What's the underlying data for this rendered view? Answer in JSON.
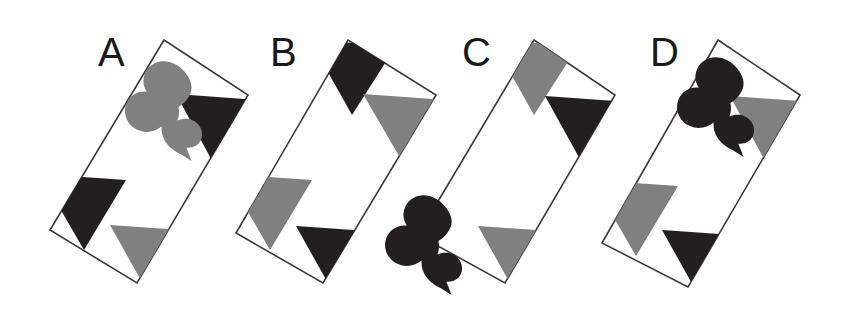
{
  "figure": {
    "kind": "visual-puzzle-figure",
    "background_color": "#ffffff",
    "width": 845,
    "height": 312,
    "palette": {
      "black": "#231f20",
      "gray": "#808080",
      "white": "#ffffff",
      "outline": "#3b3b3b",
      "label": "#1a1a1a"
    },
    "card_geometry": {
      "description": "tilted rectangle rotated clockwise about 24 degrees",
      "width": 100,
      "height": 215,
      "rotation_deg": 24
    },
    "cards": [
      {
        "label": "A",
        "label_x": 98,
        "label_y": 32,
        "center_x": 149,
        "center_y": 161,
        "corner_shapes": [
          {
            "position": "top-left",
            "type": "club",
            "color": "#808080"
          },
          {
            "position": "top-right",
            "type": "triangle",
            "color": "#231f20"
          },
          {
            "position": "bottom-left",
            "type": "triangle",
            "color": "#231f20"
          },
          {
            "position": "bottom-right",
            "type": "triangle",
            "color": "#808080"
          }
        ]
      },
      {
        "label": "B",
        "label_x": 270,
        "label_y": 32,
        "center_x": 336,
        "center_y": 161,
        "corner_shapes": [
          {
            "position": "top-left",
            "type": "triangle",
            "color": "#231f20"
          },
          {
            "position": "top-right",
            "type": "triangle",
            "color": "#808080"
          },
          {
            "position": "bottom-left",
            "type": "triangle",
            "color": "#808080"
          },
          {
            "position": "bottom-right",
            "type": "triangle",
            "color": "#231f20"
          }
        ]
      },
      {
        "label": "C",
        "label_x": 462,
        "label_y": 32,
        "center_x": 518,
        "center_y": 161,
        "corner_shapes": [
          {
            "position": "top-left",
            "type": "triangle",
            "color": "#808080"
          },
          {
            "position": "top-right",
            "type": "triangle",
            "color": "#231f20"
          },
          {
            "position": "bottom-left",
            "type": "club",
            "color": "#231f20"
          },
          {
            "position": "bottom-right",
            "type": "triangle",
            "color": "#808080"
          }
        ]
      },
      {
        "label": "D",
        "label_x": 650,
        "label_y": 32,
        "center_x": 702,
        "center_y": 163,
        "corner_shapes": [
          {
            "position": "top-left",
            "type": "club",
            "color": "#231f20"
          },
          {
            "position": "top-right",
            "type": "triangle",
            "color": "#808080"
          },
          {
            "position": "bottom-left",
            "type": "triangle",
            "color": "#808080"
          },
          {
            "position": "bottom-right",
            "type": "triangle",
            "color": "#231f20"
          }
        ]
      }
    ]
  }
}
